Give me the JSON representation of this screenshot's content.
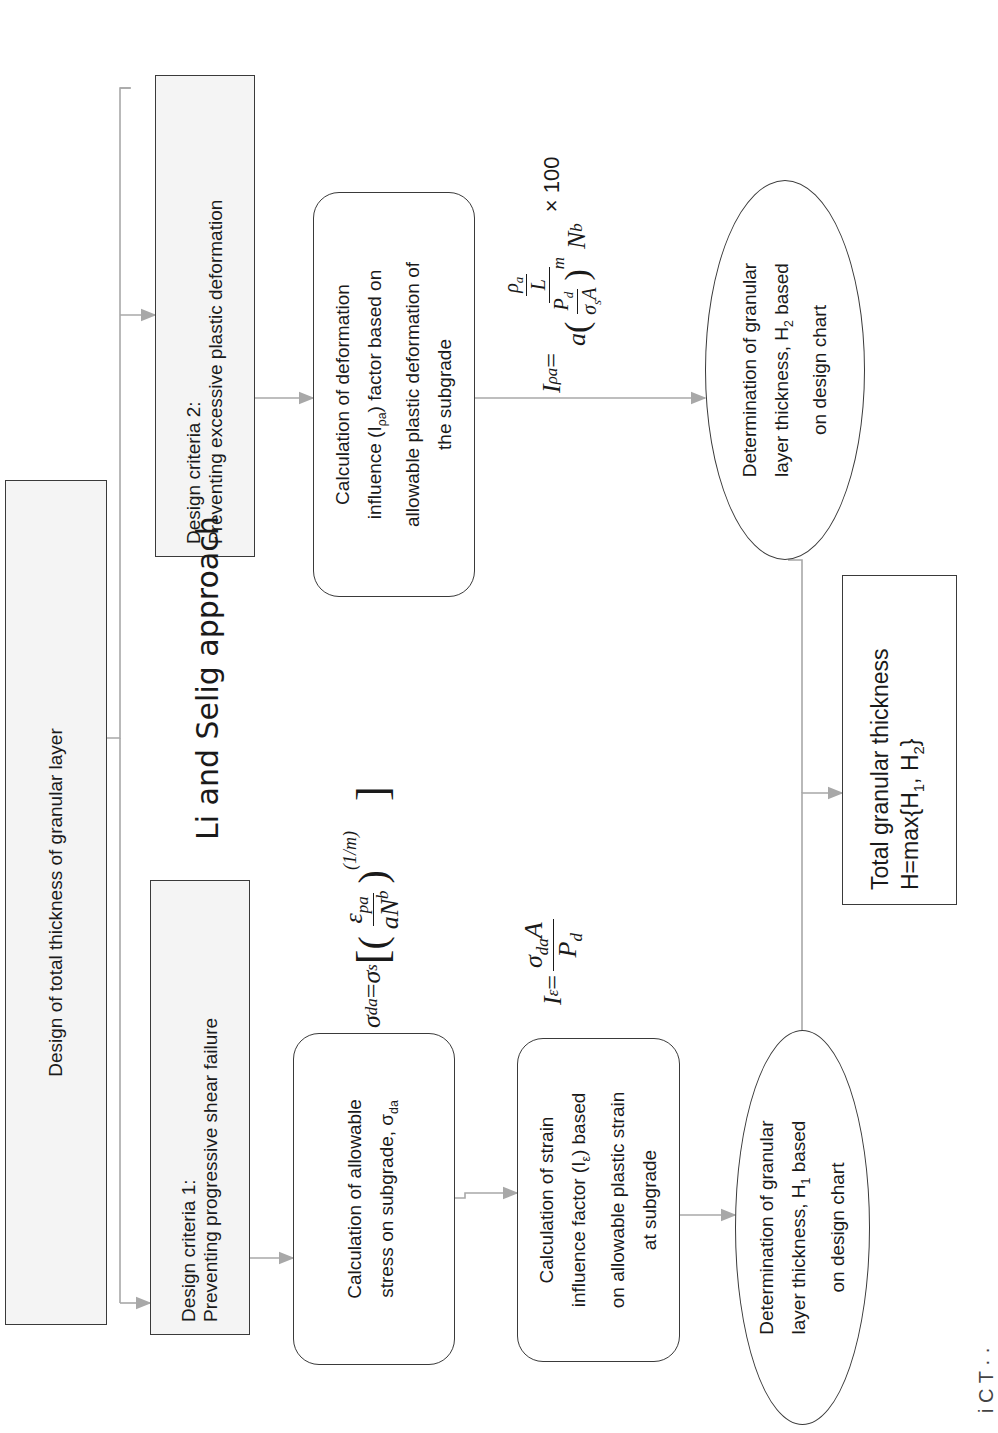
{
  "diagram": {
    "title": "Design of total thickness of granular layer",
    "approach_label": "Li and Selig approach",
    "criteria": [
      {
        "line1": "Design criteria 1:",
        "line2": "Preventing  progressive  shear failure"
      },
      {
        "line1": "Design criteria 2:",
        "line2": "Preventing  excessive plastic deformation"
      }
    ],
    "steps": {
      "allowable_stress": {
        "line1": "Calculation of allowable",
        "line2": "stress on subgrade,  σ",
        "line2_sub": "da"
      },
      "strain_factor": {
        "line1": "Calculation of strain",
        "line2a": "influence  factor (I",
        "line2_sub": "ε",
        "line2b": ")  based",
        "line3": "on allowable plastic strain",
        "line4": "at subgrade"
      },
      "deformation_factor": {
        "line1": "Calculation of deformation",
        "line2a": "influence  (I",
        "line2_sub": "ρa",
        "line2b": ") factor based on",
        "line3": "allowable plastic deformation of",
        "line4": "the subgrade"
      },
      "h1": {
        "line1": "Determination  of granular",
        "line2a": "layer thickness, H",
        "line2_sub": "1",
        "line2b": " based",
        "line3": "on design chart"
      },
      "h2": {
        "line1": "Determination  of granular",
        "line2a": "layer thickness, H",
        "line2_sub": "2",
        "line2b": " based",
        "line3": "on design chart"
      },
      "total": {
        "line1": "Total granular  thickness",
        "line2a": "H=max{H",
        "sub1": "1",
        "line2b": ",  H",
        "sub2": "2",
        "line2c": "}"
      }
    },
    "formulas": {
      "sigma_da": {
        "lhs": "σ",
        "lhs_sub": "da",
        "eq": " = ",
        "sigma_s": "σ",
        "sigma_s_sub": "s",
        "num": "ε",
        "num_sub": "pa",
        "den": "aN",
        "den_sup": "b",
        "exponent": "(1/m)"
      },
      "i_epsilon": {
        "lhs": "I",
        "lhs_sub": "ε",
        "eq": " = ",
        "num": "σ",
        "num_sub": "da",
        "num_tail": "A",
        "den": "P",
        "den_sub": "d"
      },
      "i_rho": {
        "lhs": "I",
        "lhs_sub": "ρa",
        "eq": " = ",
        "top_num": "ρ",
        "top_num_sub": "a",
        "top_den": "L",
        "den_a": "a",
        "den_inner_num": "P",
        "den_inner_num_sub": "d",
        "den_inner_den": "σ",
        "den_inner_den_sub": "s",
        "den_inner_den_tail": "A",
        "den_exp": "m",
        "den_tail": "N",
        "den_tail_sup": "b",
        "times": "× 100"
      }
    },
    "caption_fragment": "i  C  T  ·  ·"
  },
  "colors": {
    "box_border": "#3a3a3a",
    "box_fill": "#f4f4f4",
    "connector": "#a8a8a8",
    "text": "#1a1a1a"
  }
}
